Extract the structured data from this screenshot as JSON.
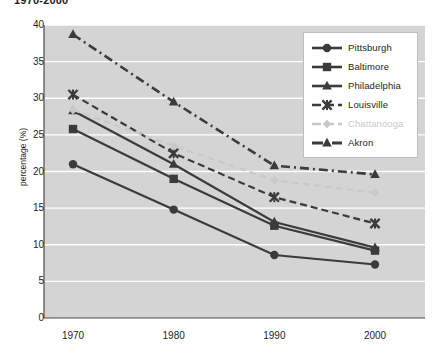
{
  "title": "1970-2000",
  "chart_data": {
    "type": "line",
    "title": "1970-2000",
    "xlabel": "",
    "ylabel": "percentage (%)",
    "x": [
      1970,
      1980,
      1990,
      2000
    ],
    "categories": [
      "1970",
      "1980",
      "1990",
      "2000"
    ],
    "xticklabels": [
      "1970",
      "1980",
      "1990",
      "2000"
    ],
    "yticklabels": [
      "0",
      "5",
      "10",
      "15",
      "20",
      "25",
      "30",
      "35",
      "40"
    ],
    "yticks": [
      0,
      5,
      10,
      15,
      20,
      25,
      30,
      35,
      40
    ],
    "ylim": [
      0,
      40
    ],
    "grid": "horizontal",
    "plot_background": "#d4d4d4",
    "legend_position": "top-right",
    "series": [
      {
        "name": "Pittsburgh",
        "values": [
          21.0,
          14.8,
          8.6,
          7.3
        ],
        "marker": "circle",
        "linestyle": "solid",
        "color": "#3b3b3b"
      },
      {
        "name": "Baltimore",
        "values": [
          25.8,
          19.0,
          12.6,
          9.2
        ],
        "marker": "square",
        "linestyle": "solid",
        "color": "#3b3b3b"
      },
      {
        "name": "Philadelphia",
        "values": [
          28.3,
          21.0,
          13.1,
          9.6
        ],
        "marker": "triangle",
        "linestyle": "solid",
        "color": "#3b3b3b"
      },
      {
        "name": "Louisville",
        "values": [
          30.5,
          22.5,
          16.5,
          12.9
        ],
        "marker": "x-star",
        "linestyle": "dashed",
        "color": "#3b3b3b"
      },
      {
        "name": "Chattanooga",
        "values": [
          28.4,
          23.5,
          18.8,
          17.1
        ],
        "marker": "diamond",
        "linestyle": "dashed",
        "color": "#c9c9c9"
      },
      {
        "name": "Akron",
        "values": [
          38.7,
          29.5,
          20.8,
          19.6
        ],
        "marker": "triangle",
        "linestyle": "dash-dot",
        "color": "#3b3b3b"
      }
    ]
  },
  "legend": {
    "items": [
      {
        "label": "Pittsburgh",
        "marker": "circle-marker",
        "color": "#3b3b3b",
        "style": "solid"
      },
      {
        "label": "Baltimore",
        "marker": "square-marker",
        "color": "#3b3b3b",
        "style": "solid"
      },
      {
        "label": "Philadelphia",
        "marker": "triangle-marker",
        "color": "#3b3b3b",
        "style": "solid"
      },
      {
        "label": "Louisville",
        "marker": "x-star-marker",
        "color": "#3b3b3b",
        "style": "dashed"
      },
      {
        "label": "Chattanooga",
        "marker": "diamond-marker",
        "color": "#c9c9c9",
        "style": "dashed"
      },
      {
        "label": "Akron",
        "marker": "triangle-marker",
        "color": "#3b3b3b",
        "style": "dash-dot"
      }
    ]
  }
}
